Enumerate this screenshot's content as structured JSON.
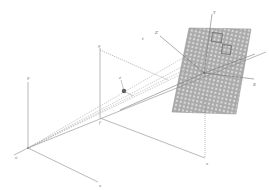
{
  "diagram": {
    "colors": {
      "background": "#ffffff",
      "axis_line": "#8a8a8a",
      "dashed_ray": "#9a9a9a",
      "plane_fill": "#a9a9a9",
      "plane_dot": "#d8d8d8",
      "marker": "#6f6f6f",
      "camera": "#555555"
    },
    "labels": {
      "world_origin": "o",
      "world_up_axis": "y",
      "world_x_axis": "x",
      "image_frame_top": "y",
      "image_frame_origin": "f",
      "image_frame_bottom": "x",
      "camera_axis": "z",
      "plane_up_axis": "Y",
      "plane_right_axis": "X",
      "plane_back_axis": "Z",
      "plane_left_label": "t"
    }
  }
}
